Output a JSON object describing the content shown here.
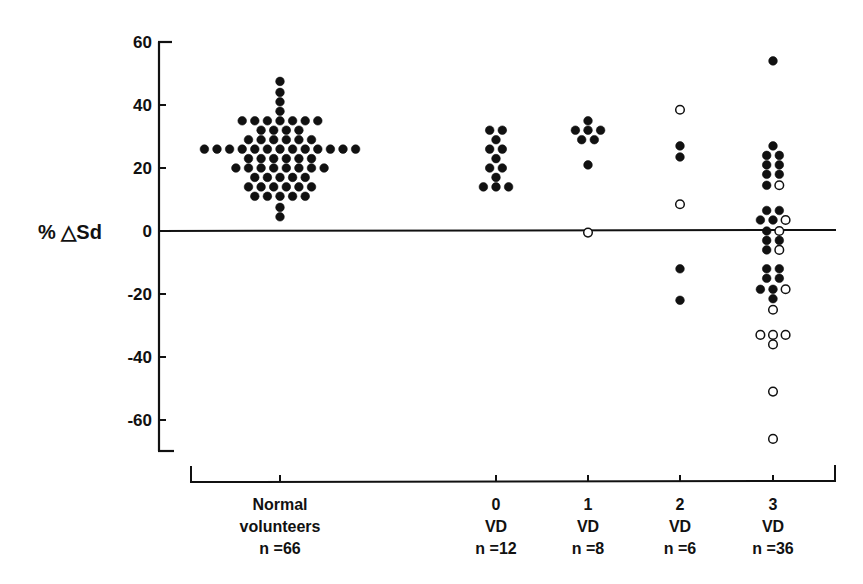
{
  "chart_data": {
    "type": "scatter",
    "subtype": "dot-strip-plot",
    "title": "",
    "ylabel": "% △Sd",
    "xlabel": "",
    "ylim": [
      -70,
      60
    ],
    "yticks": [
      60,
      40,
      20,
      0,
      -20,
      -40,
      -60
    ],
    "ytick_labels": [
      "60",
      "40",
      "20",
      "0",
      "-20",
      "-40",
      "-60"
    ],
    "grid": false,
    "reference_line": {
      "y": 0,
      "style": "solid"
    },
    "legend": {
      "filled": "filled circle",
      "open": "open circle"
    },
    "categories": [
      {
        "key": "normal",
        "line1": "Normal",
        "line2": "volunteers",
        "line3": "n =66",
        "n": 66
      },
      {
        "key": "vd0",
        "line1": "0",
        "line2": "VD",
        "line3": "n =12",
        "n": 12
      },
      {
        "key": "vd1",
        "line1": "1",
        "line2": "VD",
        "line3": "n =8",
        "n": 8
      },
      {
        "key": "vd2",
        "line1": "2",
        "line2": "VD",
        "line3": "n =6",
        "n": 6
      },
      {
        "key": "vd3",
        "line1": "3",
        "line2": "VD",
        "line3": "n =36",
        "n": 36
      }
    ],
    "series": [
      {
        "name": "Normal volunteers",
        "category": "normal",
        "rows": [
          {
            "y": 47.5,
            "filled": 1,
            "open": 0
          },
          {
            "y": 44,
            "filled": 1,
            "open": 0
          },
          {
            "y": 41,
            "filled": 1,
            "open": 0
          },
          {
            "y": 38,
            "filled": 1,
            "open": 0
          },
          {
            "y": 35,
            "filled": 7,
            "open": 0
          },
          {
            "y": 32,
            "filled": 4,
            "open": 0
          },
          {
            "y": 29,
            "filled": 6,
            "open": 0
          },
          {
            "y": 26,
            "filled": 13,
            "open": 0
          },
          {
            "y": 23,
            "filled": 6,
            "open": 0
          },
          {
            "y": 20,
            "filled": 8,
            "open": 0
          },
          {
            "y": 17,
            "filled": 5,
            "open": 0
          },
          {
            "y": 14,
            "filled": 6,
            "open": 0
          },
          {
            "y": 11,
            "filled": 5,
            "open": 0
          },
          {
            "y": 7.5,
            "filled": 1,
            "open": 0
          },
          {
            "y": 4.5,
            "filled": 1,
            "open": 0
          }
        ]
      },
      {
        "name": "0 VD",
        "category": "vd0",
        "rows": [
          {
            "y": 32,
            "filled": 2,
            "open": 0
          },
          {
            "y": 29,
            "filled": 1,
            "open": 0
          },
          {
            "y": 26,
            "filled": 2,
            "open": 0
          },
          {
            "y": 23,
            "filled": 1,
            "open": 0
          },
          {
            "y": 20,
            "filled": 2,
            "open": 0
          },
          {
            "y": 17,
            "filled": 1,
            "open": 0
          },
          {
            "y": 14,
            "filled": 3,
            "open": 0
          }
        ]
      },
      {
        "name": "1 VD",
        "category": "vd1",
        "rows": [
          {
            "y": 35,
            "filled": 1,
            "open": 0
          },
          {
            "y": 32,
            "filled": 3,
            "open": 0
          },
          {
            "y": 29,
            "filled": 2,
            "open": 0
          },
          {
            "y": 21,
            "filled": 1,
            "open": 0
          },
          {
            "y": -0.5,
            "filled": 0,
            "open": 1
          }
        ]
      },
      {
        "name": "2 VD",
        "category": "vd2",
        "rows": [
          {
            "y": 38.5,
            "filled": 0,
            "open": 1
          },
          {
            "y": 27,
            "filled": 1,
            "open": 0
          },
          {
            "y": 23.5,
            "filled": 1,
            "open": 0
          },
          {
            "y": 8.5,
            "filled": 0,
            "open": 1
          },
          {
            "y": -12,
            "filled": 1,
            "open": 0
          },
          {
            "y": -22,
            "filled": 1,
            "open": 0
          }
        ]
      },
      {
        "name": "3 VD",
        "category": "vd3",
        "rows": [
          {
            "y": 54,
            "filled": 1,
            "open": 0
          },
          {
            "y": 27,
            "filled": 1,
            "open": 0
          },
          {
            "y": 24,
            "filled": 2,
            "open": 0
          },
          {
            "y": 21,
            "filled": 2,
            "open": 0
          },
          {
            "y": 18,
            "filled": 2,
            "open": 0
          },
          {
            "y": 14.5,
            "filled": 1,
            "open": 1
          },
          {
            "y": 6.5,
            "filled": 2,
            "open": 0
          },
          {
            "y": 3.5,
            "filled": 2,
            "open": 1
          },
          {
            "y": 0,
            "filled": 1,
            "open": 1
          },
          {
            "y": -3,
            "filled": 2,
            "open": 0
          },
          {
            "y": -6,
            "filled": 1,
            "open": 1
          },
          {
            "y": -12,
            "filled": 2,
            "open": 0
          },
          {
            "y": -15,
            "filled": 2,
            "open": 0
          },
          {
            "y": -18.5,
            "filled": 2,
            "open": 1
          },
          {
            "y": -21.5,
            "filled": 1,
            "open": 0
          },
          {
            "y": -25,
            "filled": 0,
            "open": 1
          },
          {
            "y": -33,
            "filled": 0,
            "open": 3
          },
          {
            "y": -36,
            "filled": 0,
            "open": 1
          },
          {
            "y": -51,
            "filled": 0,
            "open": 1
          },
          {
            "y": -66,
            "filled": 0,
            "open": 1
          }
        ]
      }
    ]
  }
}
